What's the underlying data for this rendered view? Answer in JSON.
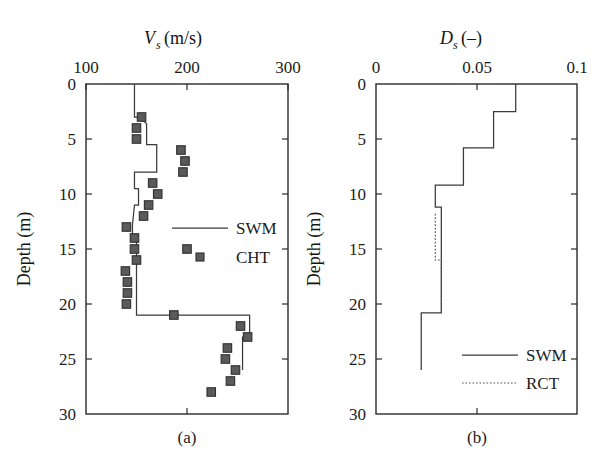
{
  "figure": {
    "background": "#ffffff",
    "line_color": "#3a3a3a",
    "marker_color": "#5a5a5a",
    "panels": [
      {
        "id": "a",
        "label": "(a)"
      },
      {
        "id": "b",
        "label": "(b)"
      }
    ]
  },
  "chart_data": [
    {
      "type": "line",
      "panel": "(a)",
      "title": "",
      "xlabel": "V_s (m/s)",
      "xlabel_parts": {
        "symbol": "V",
        "subscript": "s",
        "units": "(m/s)"
      },
      "ylabel": "Depth (m)",
      "xlim": [
        100,
        300
      ],
      "ylim": [
        0,
        30
      ],
      "y_inverted": true,
      "grid": false,
      "xticks": [
        100,
        200,
        300
      ],
      "xticklabels": [
        "100",
        "200",
        "300"
      ],
      "yticks": [
        0,
        5,
        10,
        15,
        20,
        25,
        30
      ],
      "yticklabels": [
        "0",
        "5",
        "10",
        "15",
        "20",
        "25",
        "30"
      ],
      "legend_position": "center-right",
      "series": [
        {
          "name": "SWM",
          "style": "step-line",
          "x": [
            148,
            148,
            152,
            160,
            160,
            170,
            170,
            148,
            148,
            152,
            152,
            148,
            146,
            146,
            150,
            150,
            262,
            262,
            255,
            255
          ],
          "depth": [
            0,
            3.0,
            3.0,
            3.6,
            5.5,
            5.5,
            8.0,
            8.0,
            9.5,
            9.5,
            11.0,
            11.0,
            12.8,
            13.8,
            13.8,
            21.0,
            21.0,
            23.0,
            23.0,
            26.0
          ]
        },
        {
          "name": "CHT",
          "style": "square-markers",
          "points": [
            {
              "x": 155,
              "depth": 3.0
            },
            {
              "x": 150,
              "depth": 4.0
            },
            {
              "x": 150,
              "depth": 5.0
            },
            {
              "x": 194,
              "depth": 6.0
            },
            {
              "x": 198,
              "depth": 7.0
            },
            {
              "x": 196,
              "depth": 8.0
            },
            {
              "x": 166,
              "depth": 9.0
            },
            {
              "x": 171,
              "depth": 10.0
            },
            {
              "x": 162,
              "depth": 11.0
            },
            {
              "x": 157,
              "depth": 12.0
            },
            {
              "x": 140,
              "depth": 13.0
            },
            {
              "x": 148,
              "depth": 14.0
            },
            {
              "x": 148,
              "depth": 15.0
            },
            {
              "x": 200,
              "depth": 15.0
            },
            {
              "x": 150,
              "depth": 16.0
            },
            {
              "x": 139,
              "depth": 17.0
            },
            {
              "x": 141,
              "depth": 18.0
            },
            {
              "x": 141,
              "depth": 19.0
            },
            {
              "x": 140,
              "depth": 20.0
            },
            {
              "x": 187,
              "depth": 21.0
            },
            {
              "x": 253,
              "depth": 22.0
            },
            {
              "x": 260,
              "depth": 23.0
            },
            {
              "x": 240,
              "depth": 24.0
            },
            {
              "x": 238,
              "depth": 25.0
            },
            {
              "x": 248,
              "depth": 26.0
            },
            {
              "x": 243,
              "depth": 27.0
            },
            {
              "x": 224,
              "depth": 28.0
            }
          ]
        }
      ],
      "legend": [
        {
          "label": "SWM",
          "style": "line"
        },
        {
          "label": "CHT",
          "style": "square-marker"
        }
      ]
    },
    {
      "type": "line",
      "panel": "(b)",
      "title": "",
      "xlabel": "D_s (-)",
      "xlabel_parts": {
        "symbol": "D",
        "subscript": "s",
        "units": "(–)"
      },
      "ylabel": "Depth (m)",
      "xlim": [
        0,
        0.1
      ],
      "ylim": [
        0,
        30
      ],
      "y_inverted": true,
      "grid": false,
      "xticks": [
        0,
        0.05,
        0.1
      ],
      "xticklabels": [
        "0",
        "0.05",
        "0.1"
      ],
      "yticks": [
        0,
        5,
        10,
        15,
        20,
        25,
        30
      ],
      "yticklabels": [
        "0",
        "5",
        "10",
        "15",
        "20",
        "25",
        "30"
      ],
      "legend_position": "lower-right",
      "series": [
        {
          "name": "SWM",
          "style": "step-line",
          "x": [
            0.0695,
            0.0695,
            0.0585,
            0.0585,
            0.0435,
            0.0435,
            0.0295,
            0.0295,
            0.0325,
            0.0325,
            0.0225,
            0.0225
          ],
          "depth": [
            0,
            2.5,
            2.5,
            5.8,
            5.8,
            9.2,
            9.2,
            11.2,
            11.2,
            20.8,
            20.8,
            26.0
          ]
        },
        {
          "name": "RCT",
          "style": "dotted-line",
          "x": [
            0.0295,
            0.0295,
            0.0325,
            0.0325
          ],
          "depth": [
            11.8,
            16.0,
            16.0,
            20.8
          ]
        }
      ],
      "legend": [
        {
          "label": "SWM",
          "style": "line"
        },
        {
          "label": "RCT",
          "style": "dotted"
        }
      ]
    }
  ]
}
